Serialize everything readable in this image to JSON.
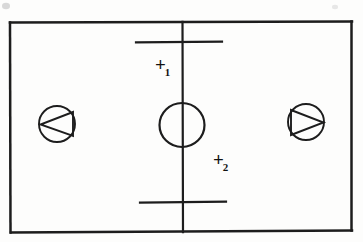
{
  "figure": {
    "kind": "hand-drawn-schematic",
    "background_color": "#fdfdfc",
    "ink_color": "#1d1d1d",
    "width": 363,
    "height": 242
  },
  "markers": [
    {
      "id": "marker-1",
      "symbol": "+",
      "subscript": "1",
      "full_text": "+1",
      "x": 165,
      "y": 64
    },
    {
      "id": "marker-2",
      "symbol": "+",
      "subscript": "2",
      "full_text": "+2",
      "x": 223,
      "y": 159
    }
  ],
  "shapes": {
    "boundary_rectangle": {
      "name": "outer-boundary-rectangle",
      "left": 9,
      "top": 22,
      "right": 352,
      "bottom": 232
    },
    "center_vertical_line": {
      "name": "vertical-centerline",
      "x": 182,
      "y_top": 22,
      "y_bottom": 232
    },
    "crossbar_top": {
      "name": "upper-horizontal-bar",
      "x_start": 136,
      "x_end": 222,
      "y": 42
    },
    "crossbar_bottom": {
      "name": "lower-horizontal-bar",
      "x_start": 140,
      "x_end": 226,
      "y": 202
    },
    "center_circle": {
      "name": "center-circle",
      "cx": 182,
      "cy": 125,
      "r": 22
    },
    "pump_left": {
      "name": "pump-symbol-left",
      "cx": 57,
      "cy": 124,
      "r": 18,
      "triangle_direction": "left"
    },
    "pump_right": {
      "name": "pump-symbol-right",
      "cx": 306,
      "cy": 122,
      "r": 18,
      "triangle_direction": "right"
    }
  },
  "artifacts": [
    {
      "name": "smudge-top-left",
      "cx": 6,
      "cy": 6,
      "rx": 4,
      "ry": 3.2
    },
    {
      "name": "smudge-top-right",
      "cx": 335,
      "cy": 7,
      "rx": 3,
      "ry": 2.2
    }
  ]
}
